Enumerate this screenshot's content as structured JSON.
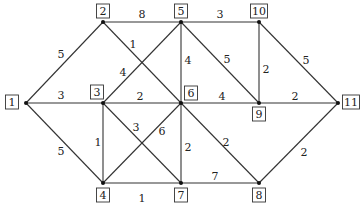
{
  "diagram": {
    "type": "weighted-undirected-graph",
    "nodes": [
      {
        "id": "1",
        "x": 26,
        "y": 103,
        "lx": 12,
        "ly": 102
      },
      {
        "id": "2",
        "x": 103,
        "y": 22,
        "lx": 103,
        "ly": 11
      },
      {
        "id": "3",
        "x": 103,
        "y": 103,
        "lx": 97,
        "ly": 92
      },
      {
        "id": "4",
        "x": 103,
        "y": 183,
        "lx": 103,
        "ly": 195
      },
      {
        "id": "5",
        "x": 181,
        "y": 22,
        "lx": 181,
        "ly": 11
      },
      {
        "id": "6",
        "x": 181,
        "y": 103,
        "lx": 191,
        "ly": 93
      },
      {
        "id": "7",
        "x": 181,
        "y": 183,
        "lx": 181,
        "ly": 195
      },
      {
        "id": "8",
        "x": 259,
        "y": 183,
        "lx": 259,
        "ly": 195
      },
      {
        "id": "9",
        "x": 259,
        "y": 103,
        "lx": 259,
        "ly": 114
      },
      {
        "id": "10",
        "x": 259,
        "y": 22,
        "lx": 259,
        "ly": 11
      },
      {
        "id": "11",
        "x": 338,
        "y": 103,
        "lx": 351,
        "ly": 102
      }
    ],
    "edges": [
      {
        "from": "1",
        "to": "2",
        "weight": "5",
        "wx": 61,
        "wy": 55
      },
      {
        "from": "1",
        "to": "3",
        "weight": "3",
        "wx": 61,
        "wy": 96
      },
      {
        "from": "1",
        "to": "4",
        "weight": "5",
        "wx": 61,
        "wy": 152
      },
      {
        "from": "2",
        "to": "5",
        "weight": "8",
        "wx": 142,
        "wy": 15
      },
      {
        "from": "2",
        "to": "6",
        "weight": "1",
        "wx": 133,
        "wy": 45
      },
      {
        "from": "3",
        "to": "5",
        "weight": "4",
        "wx": 123,
        "wy": 73
      },
      {
        "from": "3",
        "to": "6",
        "weight": "2",
        "wx": 140,
        "wy": 97
      },
      {
        "from": "3",
        "to": "4",
        "weight": "1",
        "wx": 98,
        "wy": 143
      },
      {
        "from": "3",
        "to": "7",
        "weight": "3",
        "wx": 136,
        "wy": 128
      },
      {
        "from": "4",
        "to": "6",
        "weight": "6",
        "wx": 162,
        "wy": 132
      },
      {
        "from": "4",
        "to": "7",
        "weight": "1",
        "wx": 142,
        "wy": 199
      },
      {
        "from": "5",
        "to": "10",
        "weight": "3",
        "wx": 220,
        "wy": 15
      },
      {
        "from": "5",
        "to": "6",
        "weight": "4",
        "wx": 188,
        "wy": 61
      },
      {
        "from": "5",
        "to": "9",
        "weight": "5",
        "wx": 227,
        "wy": 60
      },
      {
        "from": "6",
        "to": "9",
        "weight": "4",
        "wx": 222,
        "wy": 97
      },
      {
        "from": "6",
        "to": "7",
        "weight": "2",
        "wx": 188,
        "wy": 148
      },
      {
        "from": "6",
        "to": "8",
        "weight": "2",
        "wx": 226,
        "wy": 143
      },
      {
        "from": "7",
        "to": "8",
        "weight": "7",
        "wx": 215,
        "wy": 177
      },
      {
        "from": "10",
        "to": "9",
        "weight": "2",
        "wx": 266,
        "wy": 70
      },
      {
        "from": "10",
        "to": "11",
        "weight": "5",
        "wx": 306,
        "wy": 61
      },
      {
        "from": "9",
        "to": "11",
        "weight": "2",
        "wx": 295,
        "wy": 97
      },
      {
        "from": "8",
        "to": "11",
        "weight": "2",
        "wx": 304,
        "wy": 153
      }
    ]
  }
}
